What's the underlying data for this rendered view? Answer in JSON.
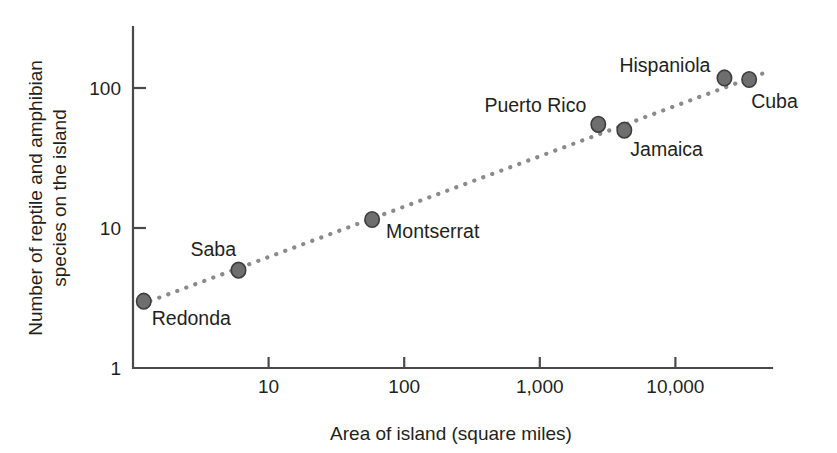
{
  "chart_data": {
    "type": "scatter",
    "title": "",
    "xlabel": "Area of island (square miles)",
    "ylabel": "Number of reptile and amphibian species on the island",
    "ylabel_line1": "Number of reptile and amphibian",
    "ylabel_line2": "species on the island",
    "xscale": "log",
    "yscale": "log",
    "xlim": [
      1,
      56000
    ],
    "ylim": [
      1,
      240
    ],
    "grid": false,
    "legend": null,
    "xticks": [
      10,
      100,
      1000,
      10000
    ],
    "xticklabels": [
      "10",
      "100",
      "1,000",
      "10,000"
    ],
    "yticks": [
      1,
      10,
      100
    ],
    "yticklabels": [
      "1",
      "10",
      "100"
    ],
    "marker_color": "#6e6e6e",
    "marker_edge_color": "#3d3d3d",
    "trendline_color": "#8a8a8a",
    "trendline_style": "dotted",
    "axis_color": "#4a4a4a",
    "points": [
      {
        "name": "Redonda",
        "area": 1.2,
        "species": 3,
        "label_dx": 8,
        "label_dy": 24,
        "anchor": "start"
      },
      {
        "name": "Saba",
        "area": 6,
        "species": 5,
        "label_dx": -48,
        "label_dy": -14,
        "anchor": "start"
      },
      {
        "name": "Montserrat",
        "area": 58,
        "species": 11.5,
        "label_dx": 14,
        "label_dy": 18,
        "anchor": "start"
      },
      {
        "name": "Puerto Rico",
        "area": 2700,
        "species": 55,
        "label_dx": -12,
        "label_dy": -12,
        "anchor": "end"
      },
      {
        "name": "Jamaica",
        "area": 4200,
        "species": 50,
        "label_dx": 6,
        "label_dy": 26,
        "anchor": "start"
      },
      {
        "name": "Hispaniola",
        "area": 23000,
        "species": 118,
        "label_dx": -14,
        "label_dy": -6,
        "anchor": "end"
      },
      {
        "name": "Cuba",
        "area": 35000,
        "species": 115,
        "label_dx": 2,
        "label_dy": 28,
        "anchor": "start"
      }
    ],
    "trendline": {
      "x_start": 1.15,
      "y_start": 2.85,
      "x_end": 45000,
      "y_end": 128
    }
  }
}
